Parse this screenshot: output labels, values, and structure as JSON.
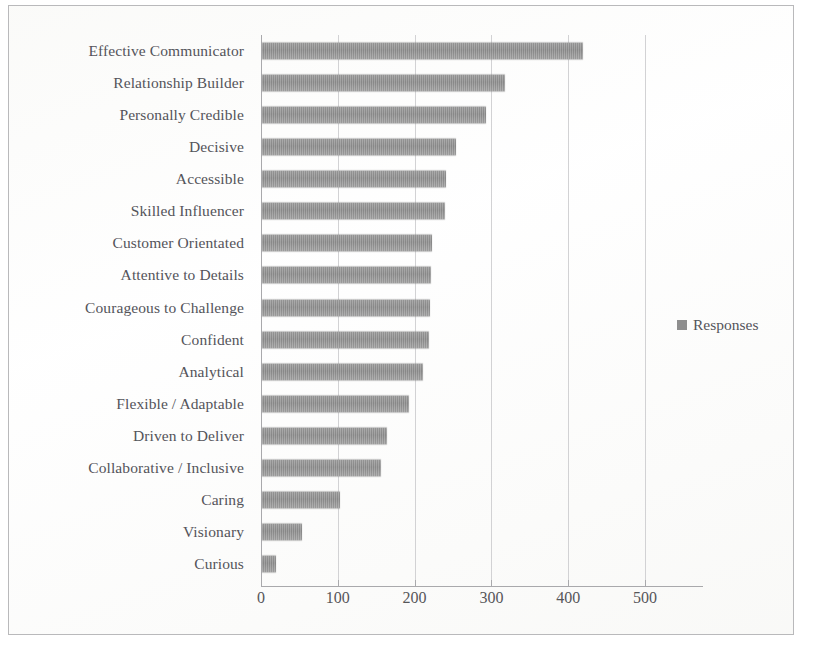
{
  "chart_data": {
    "type": "bar",
    "orientation": "horizontal",
    "title": "",
    "subtitle": "",
    "xlabel": "",
    "ylabel": "",
    "xlim": [
      0,
      500
    ],
    "x_ticks": [
      0,
      100,
      200,
      300,
      400,
      500
    ],
    "x_tick_labels": [
      "0",
      "100",
      "200",
      "300",
      "400",
      "500"
    ],
    "grid": "vertical",
    "legend_position": "right",
    "legend": [
      "Responses"
    ],
    "series_name": "Responses",
    "bar_color": "#8e8e8e",
    "categories": [
      "Effective Communicator",
      "Relationship Builder",
      "Personally Credible",
      "Decisive",
      "Accessible",
      "Skilled Influencer",
      "Customer Orientated",
      "Attentive to Details",
      "Courageous to Challenge",
      "Confident",
      "Analytical",
      "Flexible / Adaptable",
      "Driven to Deliver",
      "Collaborative / Inclusive",
      "Caring",
      "Visionary",
      "Curious"
    ],
    "values": [
      418,
      317,
      292,
      253,
      240,
      238,
      222,
      220,
      219,
      218,
      210,
      192,
      163,
      155,
      102,
      52,
      18
    ],
    "series": [
      {
        "name": "Responses",
        "values": [
          418,
          317,
          292,
          253,
          240,
          238,
          222,
          220,
          219,
          218,
          210,
          192,
          163,
          155,
          102,
          52,
          18
        ]
      }
    ]
  },
  "legend": {
    "marker_name": "legend-swatch",
    "label": "Responses"
  }
}
